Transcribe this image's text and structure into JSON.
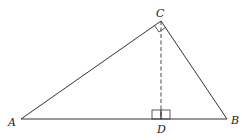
{
  "diagram": {
    "type": "right-triangle-with-altitude",
    "colors": {
      "stroke": "#333333",
      "background": "#ffffff"
    },
    "points": {
      "A": {
        "label": "A",
        "x": 21,
        "y": 119
      },
      "B": {
        "label": "B",
        "x": 227,
        "y": 119
      },
      "C": {
        "label": "C",
        "x": 161,
        "y": 21
      },
      "D": {
        "label": "D",
        "x": 161,
        "y": 119
      }
    },
    "segments": [
      {
        "from": "A",
        "to": "B",
        "style": "solid"
      },
      {
        "from": "A",
        "to": "C",
        "style": "solid"
      },
      {
        "from": "C",
        "to": "B",
        "style": "solid"
      },
      {
        "from": "C",
        "to": "D",
        "style": "dashed"
      }
    ],
    "right_angles": [
      "C",
      "D"
    ]
  }
}
